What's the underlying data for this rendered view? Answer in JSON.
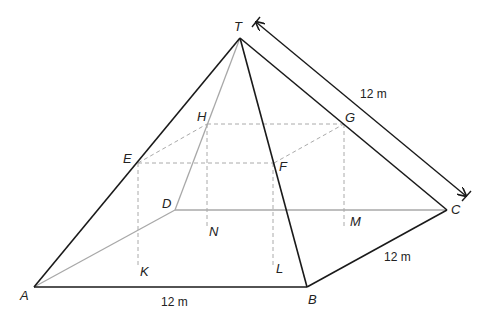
{
  "diagram": {
    "colors": {
      "edge": "#1a1a1a",
      "hidden_edge": "#a8a8a8",
      "dashed": "#aaaaaa",
      "background": "#ffffff"
    },
    "points": {
      "T": {
        "label": "T",
        "x": 240,
        "y": 38
      },
      "A": {
        "label": "A",
        "x": 34,
        "y": 287
      },
      "B": {
        "label": "B",
        "x": 307,
        "y": 287
      },
      "C": {
        "label": "C",
        "x": 447,
        "y": 210
      },
      "D": {
        "label": "D",
        "x": 175,
        "y": 210
      },
      "E": {
        "label": "E",
        "x": 138,
        "y": 163
      },
      "F": {
        "label": "F",
        "x": 274,
        "y": 163
      },
      "G": {
        "label": "G",
        "x": 344,
        "y": 124
      },
      "H": {
        "label": "H",
        "x": 207,
        "y": 124
      },
      "K": {
        "label": "K",
        "x": 137,
        "y": 267
      },
      "L": {
        "label": "L",
        "x": 273,
        "y": 267
      },
      "M": {
        "label": "M",
        "x": 343,
        "y": 227
      },
      "N": {
        "label": "N",
        "x": 207,
        "y": 227
      }
    },
    "dimensions": {
      "AB": "12 m",
      "BC": "12 m",
      "TC": "12 m"
    }
  }
}
